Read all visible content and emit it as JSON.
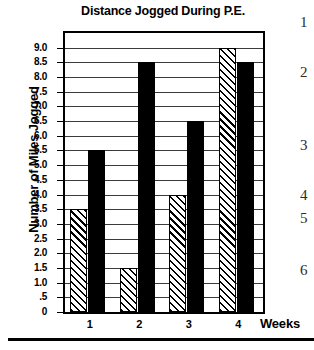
{
  "chart_data": {
    "type": "bar",
    "title": "Distance Jogged During P.E.",
    "xlabel": "Weeks",
    "ylabel": "Number of Miles Jogged",
    "categories": [
      "1",
      "2",
      "3",
      "4"
    ],
    "series": [
      {
        "name": "hatched",
        "values": [
          3.5,
          1.5,
          4.0,
          9.0
        ],
        "fill": "diagonal-hatch"
      },
      {
        "name": "solid",
        "values": [
          5.5,
          8.5,
          6.5,
          8.5
        ],
        "fill": "#000000"
      }
    ],
    "ylim": [
      0,
      9.5
    ],
    "ytick_values": [
      0,
      0.5,
      1.0,
      1.5,
      2.0,
      2.5,
      3.0,
      3.5,
      4.0,
      4.5,
      5.0,
      5.5,
      6.0,
      6.5,
      7.0,
      7.5,
      8.0,
      8.5,
      9.0
    ],
    "ytick_labels": [
      "0",
      ".5",
      "1.0",
      "1.5",
      "2.0",
      "2.5",
      "3.0",
      "3.5",
      "4.0",
      "4.5",
      "5.0",
      "5.5",
      "6.0",
      "6.5",
      "7.0",
      "7.5",
      "8.0",
      "8.5",
      "9.0"
    ],
    "grid": true,
    "legend": "none"
  },
  "side_list": {
    "items": [
      {
        "label": "1",
        "y": 14
      },
      {
        "label": "2",
        "y": 64
      },
      {
        "label": "3",
        "y": 137
      },
      {
        "label": "4",
        "y": 187
      },
      {
        "label": "5",
        "y": 210
      },
      {
        "label": "6",
        "y": 262
      }
    ]
  }
}
